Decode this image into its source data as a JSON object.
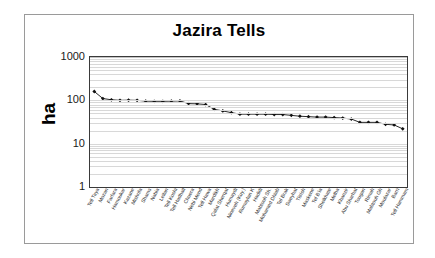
{
  "chart_data": {
    "type": "line",
    "title": "Jazira Tells",
    "xlabel": "",
    "ylabel": "ha",
    "yscale": "log",
    "ylim": [
      1,
      1000
    ],
    "yticks": [
      "1",
      "10",
      "100",
      "1000"
    ],
    "grid": true,
    "legend": false,
    "marker": "diamond",
    "categories": [
      "Tell Taya",
      "Mozan",
      "Farfara",
      "Hamoukar",
      "Kazane",
      "Mishrifa",
      "Shams",
      "Nabia",
      "Leilan",
      "Tell Koshi",
      "Tell Hadhail",
      "Chuera",
      "Nebi Mend",
      "Tell Hawa",
      "Mardikh",
      "Qalat Sherqat",
      "Humaydi",
      "Nineveh (Kuy.)",
      "Rumaylan K",
      "Hadidi",
      "Mabtouh Sh.",
      "Mohamed Dhiab",
      "Tel Brak",
      "Sweyhat",
      "Titrish",
      "Maskene",
      "Tel B'ia",
      "Sheikhate",
      "Melha",
      "Khanzir",
      "Abu Sharhat",
      "Tougan",
      "Rimah",
      "Mabtouh Gh",
      "Moulazar",
      "Barri",
      "Tell Hammam"
    ],
    "values": [
      160,
      110,
      103,
      100,
      101,
      100,
      96,
      95,
      95,
      96,
      97,
      84,
      83,
      80,
      62,
      57,
      52,
      48,
      48,
      48,
      48,
      47,
      47,
      45,
      43,
      42,
      41,
      41,
      40,
      39,
      37,
      31,
      31,
      31,
      28,
      27,
      22
    ],
    "series_name": "ha"
  }
}
